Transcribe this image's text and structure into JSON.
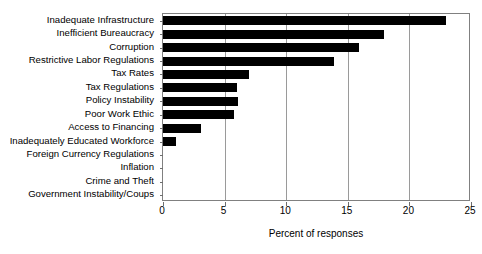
{
  "chart_data": {
    "type": "bar",
    "orientation": "horizontal",
    "title": "",
    "xlabel": "Percent of responses",
    "ylabel": "",
    "xlim": [
      0,
      25
    ],
    "xticks": [
      0,
      5,
      10,
      15,
      20,
      25
    ],
    "grid": true,
    "legend": null,
    "bar_color": "#000000",
    "categories": [
      "Inadequate Infrastructure",
      "Inefficient Bureaucracy",
      "Corruption",
      "Restrictive Labor Regulations",
      "Tax Rates",
      "Tax Regulations",
      "Policy Instability",
      "Poor Work Ethic",
      "Access to Financing",
      "Inadequately Educated Workforce",
      "Foreign Currency Regulations",
      "Inflation",
      "Crime and Theft",
      "Government Instability/Coups"
    ],
    "values": [
      23.0,
      17.9,
      15.9,
      13.9,
      7.0,
      6.0,
      6.1,
      5.8,
      3.1,
      1.05,
      0,
      0,
      0,
      0
    ]
  }
}
